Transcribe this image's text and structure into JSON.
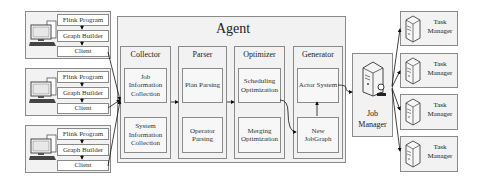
{
  "clients": [
    {
      "steps": [
        "Flink Program",
        "Graph Builder",
        "Client"
      ]
    },
    {
      "steps": [
        "Flink Program",
        "Graph Builder",
        "Client"
      ]
    },
    {
      "steps": [
        "Flink Program",
        "Graph Builder",
        "Client"
      ]
    }
  ],
  "agent": {
    "title": "Agent",
    "columns": [
      {
        "title": "Collector",
        "items": [
          "Job Information Collection",
          "System Information Collection"
        ]
      },
      {
        "title": "Parser",
        "items": [
          "Plan Parsing",
          "Operator Parsing"
        ]
      },
      {
        "title": "Optimizer",
        "items": [
          "Scheduling Optimization",
          "Merging Optimization"
        ]
      },
      {
        "title": "Generator",
        "items": [
          "Actor System",
          "New JobGraph"
        ]
      }
    ]
  },
  "job_manager": {
    "label": "Job Manager",
    "icon": "server-with-user-icon"
  },
  "task_managers": [
    {
      "label": "Task Manager",
      "icon": "server-icon"
    },
    {
      "label": "Task Manager",
      "icon": "server-icon"
    },
    {
      "label": "Task Manager",
      "icon": "server-icon"
    },
    {
      "label": "Task Manager",
      "icon": "server-icon"
    }
  ],
  "colors": {
    "border": "#8a8a8a",
    "fill": "#f2f2f2",
    "arrow": "#111111"
  }
}
